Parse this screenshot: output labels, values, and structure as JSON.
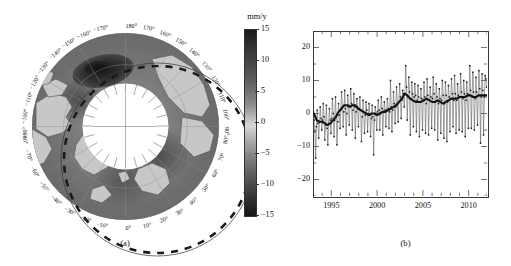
{
  "figure": {
    "panel_a_caption": "(a)",
    "panel_b_caption": "(b)"
  },
  "map": {
    "projection": "north-polar-stereographic",
    "pole_hole": true,
    "longitude_labels": [
      "180°",
      "170°",
      "160°",
      "150°",
      "140°",
      "130°",
      "120°",
      "110°",
      "100°",
      "90°",
      "80°",
      "70°",
      "60°",
      "50°",
      "40°",
      "30°",
      "20°",
      "10°",
      "0°",
      "−10°",
      "−20°",
      "−30°",
      "−40°",
      "−50°",
      "−60°",
      "−70°",
      "−80°",
      "−90°",
      "−100°",
      "−110°",
      "−120°",
      "−130°",
      "−140°",
      "−150°",
      "−160°",
      "−170°"
    ]
  },
  "colorbar": {
    "title": "mm/y",
    "ticks": [
      "15",
      "10",
      "5",
      "0",
      "−5",
      "−10",
      "−15"
    ],
    "tick_values": [
      15,
      10,
      5,
      0,
      -5,
      -10,
      -15
    ],
    "vmin": -15,
    "vmax": 15,
    "colormap": "grayscale-diverging"
  },
  "chart_data": {
    "type": "line",
    "title": "",
    "xlabel": "",
    "ylabel": "",
    "xlim": [
      1993.0,
      2012.0
    ],
    "ylim": [
      -25,
      25
    ],
    "grid": false,
    "legend": "none",
    "xticks": [
      1995,
      2000,
      2005,
      2010
    ],
    "xtick_labels": [
      "1995",
      "2000",
      "2005",
      "2010"
    ],
    "xminor_step": 1,
    "yticks": [
      20,
      10,
      0,
      -10,
      -20
    ],
    "ytick_labels": [
      "20",
      "10",
      "0",
      "−10",
      "−20"
    ],
    "yminor_step": 5,
    "series": [
      {
        "name": "monthly",
        "marker": "square",
        "linewidth": 0.5,
        "x": [
          1993.04,
          1993.12,
          1993.21,
          1993.29,
          1993.37,
          1993.46,
          1993.54,
          1993.62,
          1993.71,
          1993.79,
          1993.87,
          1993.96,
          1994.04,
          1994.12,
          1994.21,
          1994.29,
          1994.37,
          1994.46,
          1994.54,
          1994.62,
          1994.71,
          1994.79,
          1994.87,
          1994.96,
          1995.04,
          1995.12,
          1995.21,
          1995.29,
          1995.37,
          1995.46,
          1995.54,
          1995.62,
          1995.71,
          1995.79,
          1995.87,
          1995.96,
          1996.04,
          1996.12,
          1996.21,
          1996.29,
          1996.37,
          1996.46,
          1996.54,
          1996.62,
          1996.71,
          1996.79,
          1996.87,
          1996.96,
          1997.04,
          1997.12,
          1997.21,
          1997.29,
          1997.37,
          1997.46,
          1997.54,
          1997.62,
          1997.71,
          1997.79,
          1997.87,
          1997.96,
          1998.04,
          1998.12,
          1998.21,
          1998.29,
          1998.37,
          1998.46,
          1998.54,
          1998.62,
          1998.71,
          1998.79,
          1998.87,
          1998.96,
          1999.04,
          1999.12,
          1999.21,
          1999.29,
          1999.37,
          1999.46,
          1999.54,
          1999.62,
          1999.71,
          1999.79,
          1999.87,
          1999.96,
          2000.04,
          2000.12,
          2000.21,
          2000.29,
          2000.37,
          2000.46,
          2000.54,
          2000.62,
          2000.71,
          2000.79,
          2000.87,
          2000.96,
          2001.04,
          2001.12,
          2001.21,
          2001.29,
          2001.37,
          2001.46,
          2001.54,
          2001.62,
          2001.71,
          2001.79,
          2001.87,
          2001.96,
          2002.04,
          2002.12,
          2002.21,
          2002.29,
          2002.37,
          2002.46,
          2002.54,
          2002.62,
          2002.71,
          2002.79,
          2002.87,
          2002.96,
          2003.04,
          2003.12,
          2003.21,
          2003.29,
          2003.37,
          2003.46,
          2003.54,
          2003.62,
          2003.71,
          2003.79,
          2003.87,
          2003.96,
          2004.04,
          2004.12,
          2004.21,
          2004.29,
          2004.37,
          2004.46,
          2004.54,
          2004.62,
          2004.71,
          2004.79,
          2004.87,
          2004.96,
          2005.04,
          2005.12,
          2005.21,
          2005.29,
          2005.37,
          2005.46,
          2005.54,
          2005.62,
          2005.71,
          2005.79,
          2005.87,
          2005.96,
          2006.04,
          2006.12,
          2006.21,
          2006.29,
          2006.37,
          2006.46,
          2006.54,
          2006.62,
          2006.71,
          2006.79,
          2006.87,
          2006.96,
          2007.04,
          2007.12,
          2007.21,
          2007.29,
          2007.37,
          2007.46,
          2007.54,
          2007.62,
          2007.71,
          2007.79,
          2007.87,
          2007.96,
          2008.04,
          2008.12,
          2008.21,
          2008.29,
          2008.37,
          2008.46,
          2008.54,
          2008.62,
          2008.71,
          2008.79,
          2008.87,
          2008.96,
          2009.04,
          2009.12,
          2009.21,
          2009.29,
          2009.37,
          2009.46,
          2009.54,
          2009.62,
          2009.71,
          2009.79,
          2009.87,
          2009.96,
          2010.04,
          2010.12,
          2010.21,
          2010.29,
          2010.37,
          2010.46,
          2010.54,
          2010.62,
          2010.71,
          2010.79,
          2010.87,
          2010.96,
          2011.04,
          2011.12,
          2011.21,
          2011.29,
          2011.37,
          2011.46,
          2011.54,
          2011.62,
          2011.71,
          2011.79,
          2011.87,
          2011.96
        ],
        "values": [
          0.5,
          -2.0,
          -5.5,
          -13.5,
          -4.0,
          1.0,
          -3.0,
          -7.5,
          -2.5,
          2.0,
          -1.5,
          -5.0,
          -2.0,
          3.0,
          -1.0,
          -8.0,
          -3.5,
          2.5,
          -4.5,
          -9.5,
          -3.0,
          1.5,
          -2.0,
          -6.0,
          -1.5,
          4.5,
          0.0,
          -7.0,
          -2.0,
          5.0,
          -1.0,
          -9.5,
          -2.5,
          3.0,
          -0.5,
          -4.5,
          1.0,
          6.5,
          2.0,
          -4.0,
          0.5,
          7.0,
          1.5,
          -6.5,
          0.0,
          5.5,
          2.5,
          -3.5,
          2.0,
          7.5,
          3.0,
          -5.0,
          1.0,
          6.0,
          2.0,
          -7.5,
          0.5,
          4.5,
          2.0,
          -4.0,
          1.5,
          5.0,
          1.0,
          -8.5,
          -1.0,
          4.0,
          0.5,
          -6.0,
          -0.5,
          3.5,
          1.0,
          -5.5,
          0.0,
          3.0,
          -0.5,
          -7.0,
          -1.5,
          2.5,
          -1.0,
          -12.5,
          -2.0,
          2.0,
          0.0,
          -5.0,
          0.5,
          4.0,
          1.0,
          -5.0,
          0.0,
          5.0,
          1.5,
          -6.5,
          0.5,
          3.5,
          1.0,
          -4.0,
          1.0,
          4.5,
          1.5,
          -4.5,
          0.5,
          10.0,
          2.0,
          -5.5,
          1.0,
          6.5,
          3.0,
          -3.0,
          2.0,
          8.0,
          3.0,
          -2.5,
          3.5,
          9.0,
          5.0,
          -1.5,
          4.0,
          7.0,
          6.0,
          2.0,
          6.0,
          14.5,
          8.0,
          -2.0,
          5.0,
          11.0,
          6.5,
          -6.5,
          4.5,
          9.5,
          6.0,
          -4.0,
          5.0,
          9.0,
          5.5,
          -5.5,
          4.0,
          8.5,
          5.0,
          -7.0,
          3.5,
          7.5,
          4.5,
          -5.0,
          4.0,
          9.5,
          5.0,
          -6.0,
          3.0,
          10.5,
          5.5,
          -6.5,
          4.0,
          8.0,
          5.0,
          -4.5,
          4.5,
          11.0,
          6.0,
          -5.0,
          3.5,
          9.0,
          5.0,
          -8.0,
          3.0,
          7.5,
          4.5,
          -6.0,
          4.0,
          10.0,
          5.5,
          -7.5,
          3.0,
          9.5,
          5.5,
          -8.5,
          3.5,
          8.5,
          5.0,
          -5.5,
          4.5,
          10.5,
          6.0,
          -4.0,
          4.0,
          11.5,
          6.0,
          -6.0,
          4.0,
          9.0,
          5.5,
          -5.0,
          5.0,
          12.0,
          6.5,
          -5.5,
          4.5,
          10.0,
          6.0,
          -7.0,
          4.0,
          9.5,
          6.0,
          -4.5,
          5.5,
          14.5,
          7.0,
          -4.5,
          5.0,
          12.5,
          6.5,
          -5.0,
          4.5,
          11.0,
          6.5,
          -3.5,
          5.5,
          13.0,
          7.5,
          -9.0,
          5.0,
          12.0,
          7.0,
          -6.5,
          5.0,
          11.5,
          10.5,
          8.0
        ]
      },
      {
        "name": "smoothed",
        "marker": "none",
        "linewidth": 2.0,
        "x": [
          1993.1,
          1993.4,
          1993.7,
          1994.0,
          1994.3,
          1994.6,
          1994.9,
          1995.2,
          1995.5,
          1995.8,
          1996.1,
          1996.4,
          1996.7,
          1997.0,
          1997.3,
          1997.6,
          1997.9,
          1998.2,
          1998.5,
          1998.8,
          1999.1,
          1999.4,
          1999.7,
          2000.0,
          2000.3,
          2000.6,
          2000.9,
          2001.2,
          2001.5,
          2001.8,
          2002.1,
          2002.4,
          2002.7,
          2003.0,
          2003.3,
          2003.6,
          2003.9,
          2004.2,
          2004.5,
          2004.8,
          2005.1,
          2005.4,
          2005.7,
          2006.0,
          2006.3,
          2006.6,
          2006.9,
          2007.2,
          2007.5,
          2007.8,
          2008.1,
          2008.4,
          2008.7,
          2009.0,
          2009.3,
          2009.6,
          2009.9,
          2010.2,
          2010.5,
          2010.8,
          2011.1,
          2011.4,
          2011.7,
          2011.95
        ],
        "values": [
          0.0,
          -2.0,
          -2.5,
          -2.5,
          -3.0,
          -3.5,
          -3.0,
          -2.0,
          -1.0,
          0.5,
          1.5,
          2.5,
          2.5,
          2.0,
          2.5,
          2.5,
          1.5,
          1.0,
          0.5,
          0.0,
          -0.5,
          0.0,
          0.0,
          -0.5,
          0.0,
          0.5,
          0.5,
          1.0,
          1.5,
          2.0,
          2.5,
          3.5,
          4.5,
          6.0,
          5.5,
          4.5,
          4.0,
          3.5,
          3.5,
          3.5,
          4.0,
          4.5,
          4.0,
          3.5,
          3.5,
          4.0,
          3.5,
          3.0,
          3.5,
          4.0,
          4.5,
          4.5,
          4.5,
          5.0,
          5.0,
          5.0,
          5.5,
          5.5,
          5.0,
          5.0,
          5.5,
          5.5,
          5.5,
          5.5
        ]
      }
    ]
  }
}
